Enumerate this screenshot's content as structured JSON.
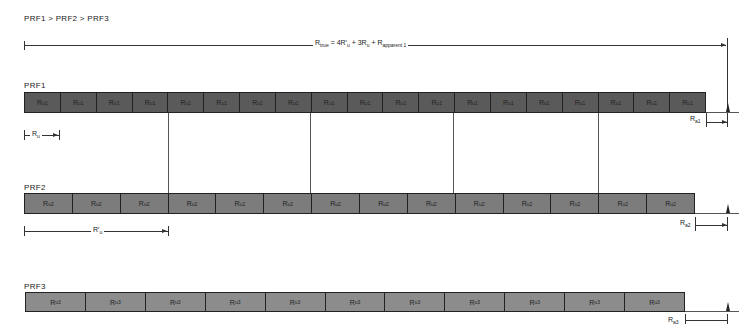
{
  "title": "PRF1 > PRF2 > PRF3",
  "equation": {
    "prefix": "R",
    "prefix_sub": "true",
    "middle": " = 4R′",
    "middle_sub": "u",
    "plus3": " + 3R",
    "plus3_sub": "u",
    "plus_app": " + R",
    "plus_app_sub": "apparent 1"
  },
  "prf1": {
    "label": "PRF1",
    "cell_label": "R",
    "cell_sub": "u1",
    "cell_count": 19,
    "color": "#5a5a5a",
    "marker_label": "R",
    "marker_sub": "u",
    "apparent_label": "R",
    "apparent_sub": "a1"
  },
  "prf2": {
    "label": "PRF2",
    "cell_label": "R",
    "cell_sub": "u2",
    "cell_count": 14,
    "color": "#7c7c7c",
    "marker_label": "R′",
    "marker_sub": "u",
    "apparent_label": "R",
    "apparent_sub": "a2"
  },
  "prf3": {
    "label": "PRF3",
    "cell_label": "R",
    "cell_sub": "u3",
    "cell_count": 11,
    "color": "#8c8c8c",
    "apparent_label": "R",
    "apparent_sub": "a3"
  }
}
